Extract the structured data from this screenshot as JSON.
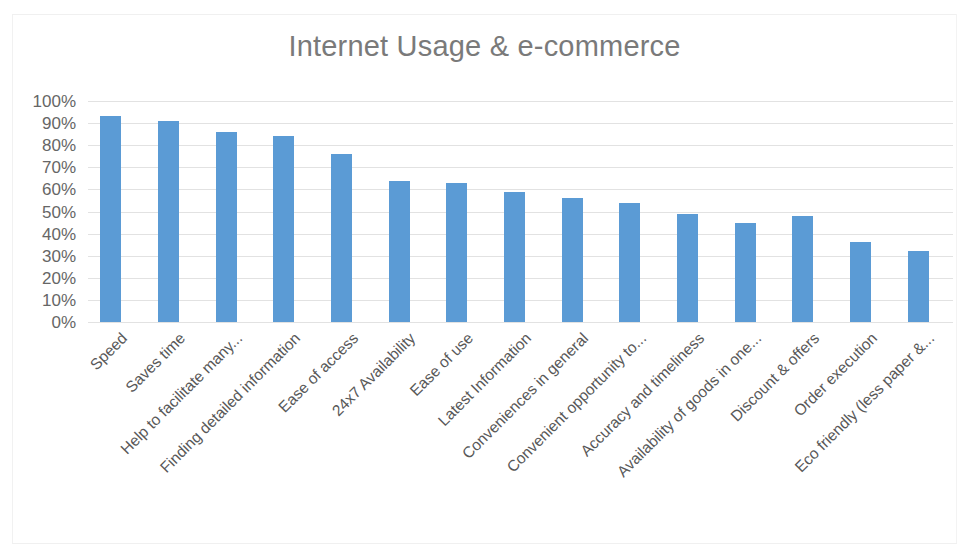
{
  "chart_data": {
    "type": "bar",
    "title": "Internet Usage & e-commerce",
    "xlabel": "",
    "ylabel": "",
    "ylim": [
      0,
      100
    ],
    "grid": true,
    "legend": "none",
    "orientation": "vertical",
    "bar_color": "#5B9BD5",
    "value_format": "percent",
    "categories": [
      "Speed",
      "Saves time",
      "Help to facilitate many...",
      "Finding detailed information",
      "Ease of access",
      "24x7 Availability",
      "Ease of use",
      "Latest Information",
      "Conveniences in general",
      "Convenient opportunity to...",
      "Accuracy and timeliness",
      "Availability of goods in one...",
      "Discount & offers",
      "Order execution",
      "Eco friendly (less paper &..."
    ],
    "values": [
      93,
      91,
      86,
      84,
      76,
      64,
      63,
      59,
      56,
      54,
      49,
      45,
      48,
      36,
      32
    ],
    "ytick_labels": [
      "100%",
      "90%",
      "80%",
      "70%",
      "60%",
      "50%",
      "40%",
      "30%",
      "20%",
      "10%",
      "0%"
    ],
    "ytick_values": [
      100,
      90,
      80,
      70,
      60,
      50,
      40,
      30,
      20,
      10,
      0
    ]
  }
}
